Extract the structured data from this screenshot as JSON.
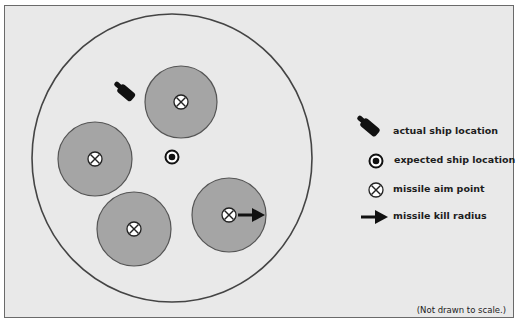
{
  "diagram": {
    "title": "",
    "colors": {
      "background": "#e9e9e9",
      "frame": "#6a6a6a",
      "outer_circle": "#444444",
      "kill_zone_fill": "#a5a5a5",
      "kill_zone_stroke": "#555555",
      "icon_dark": "#111111"
    },
    "outer_circle": {
      "cx": 172,
      "cy": 158,
      "rx": 140,
      "ry": 144
    },
    "kill_zones": [
      {
        "name": "top",
        "cx": 181,
        "cy": 102,
        "r": 36
      },
      {
        "name": "left",
        "cx": 95,
        "cy": 159,
        "r": 37
      },
      {
        "name": "bottom",
        "cx": 134,
        "cy": 229,
        "r": 37
      },
      {
        "name": "right",
        "cx": 229,
        "cy": 215,
        "r": 37,
        "shows_kill_radius_arrow": true
      }
    ],
    "actual_ship": {
      "x": 117,
      "y": 83,
      "angle": 40
    },
    "expected_ship": {
      "cx": 172,
      "cy": 157
    }
  },
  "legend": {
    "items": [
      {
        "icon": "ship-icon",
        "label": "actual ship location"
      },
      {
        "icon": "target-dot-icon",
        "label": "expected ship location"
      },
      {
        "icon": "crossed-circle-icon",
        "label": "missile aim point"
      },
      {
        "icon": "arrow-right-icon",
        "label": "missile kill radius"
      }
    ]
  },
  "footnote": "(Not drawn to scale.)"
}
